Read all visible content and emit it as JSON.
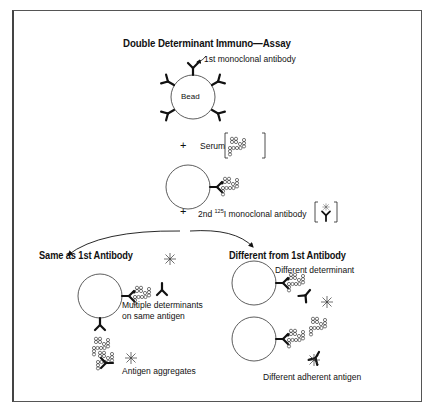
{
  "title": "Double Determinant Immuno—Assay",
  "stage1": {
    "antibody_label": "1st monoclonal antibody",
    "bead_label": "Bead"
  },
  "stage2": {
    "plus": "+",
    "serum_label": "Serum"
  },
  "stage3": {
    "plus": "+",
    "second_antibody_prefix": "2nd ",
    "second_antibody_isotope": "125",
    "second_antibody_suffix": "I monoclonal antibody"
  },
  "branches": {
    "left": {
      "heading": "Same as 1st Antibody",
      "annotations": [
        "Multiple determinants",
        "on same antigen",
        "Antigen aggregates"
      ]
    },
    "right": {
      "heading": "Different from 1st Antibody",
      "annotations": [
        "Different determinant",
        "Different adherent antigen"
      ]
    }
  },
  "colors": {
    "ink": "#111111",
    "frame": "#555555",
    "background": "#ffffff"
  }
}
